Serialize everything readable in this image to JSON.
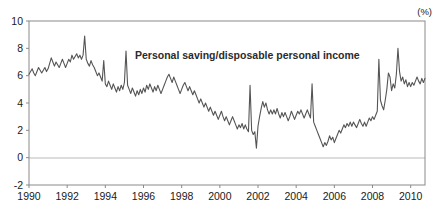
{
  "chart_data": {
    "type": "line",
    "title": "Personal saving/disposable personal income",
    "unit_label": "(%)",
    "xlabel": "",
    "ylabel": "",
    "grid": false,
    "legend_position": "inside-top-center",
    "xlim": [
      1990,
      2010.75
    ],
    "ylim": [
      -2,
      10
    ],
    "ytick_values": [
      -2,
      0,
      2,
      4,
      6,
      8,
      10
    ],
    "ytick_labels": [
      "-2",
      "0",
      "2",
      "4",
      "6",
      "8",
      "10"
    ],
    "xtick_values": [
      1990,
      1992,
      1994,
      1996,
      1998,
      2000,
      2002,
      2004,
      2006,
      2008,
      2010
    ],
    "xtick_labels": [
      "1990",
      "1992",
      "1994",
      "1996",
      "1998",
      "2000",
      "2002",
      "2004",
      "2006",
      "2008",
      "2010"
    ],
    "zero_line": 0,
    "series": [
      {
        "name": "Personal saving/disposable personal income",
        "color": "#555555",
        "x_start": 1990.0,
        "x_step": 0.08333,
        "values": [
          6.1,
          6.3,
          6.5,
          6.2,
          6.0,
          6.3,
          6.6,
          6.4,
          6.2,
          6.4,
          6.6,
          6.3,
          6.5,
          6.9,
          7.3,
          7.0,
          6.7,
          7.0,
          6.8,
          6.6,
          6.9,
          7.2,
          6.9,
          6.6,
          6.9,
          7.2,
          7.0,
          7.5,
          7.2,
          7.4,
          7.6,
          7.3,
          7.5,
          7.2,
          7.5,
          8.9,
          7.2,
          6.9,
          6.7,
          7.1,
          6.8,
          6.6,
          6.3,
          6.0,
          6.2,
          5.9,
          5.6,
          7.1,
          5.4,
          5.2,
          5.6,
          5.3,
          5.0,
          5.4,
          5.1,
          4.8,
          5.2,
          4.9,
          5.3,
          5.0,
          5.5,
          7.8,
          5.3,
          5.0,
          4.7,
          5.1,
          4.8,
          4.5,
          4.9,
          4.6,
          5.0,
          4.7,
          5.1,
          4.8,
          5.3,
          5.0,
          5.4,
          5.1,
          4.8,
          5.2,
          4.9,
          5.3,
          5.0,
          4.7,
          5.0,
          5.3,
          5.6,
          5.9,
          6.1,
          5.8,
          5.5,
          5.9,
          5.6,
          5.3,
          5.0,
          4.7,
          5.0,
          5.3,
          5.5,
          5.2,
          4.9,
          5.2,
          4.9,
          4.6,
          4.9,
          4.6,
          4.3,
          4.0,
          4.3,
          4.0,
          3.7,
          4.0,
          3.7,
          3.4,
          3.7,
          3.4,
          3.1,
          3.4,
          3.1,
          2.8,
          3.1,
          3.4,
          3.0,
          2.7,
          3.0,
          2.7,
          2.4,
          2.7,
          3.0,
          2.7,
          2.4,
          2.1,
          2.4,
          2.2,
          2.5,
          2.1,
          2.4,
          2.1,
          1.9,
          5.3,
          2.0,
          1.7,
          1.9,
          0.7,
          2.3,
          3.0,
          3.6,
          4.1,
          3.7,
          4.0,
          3.5,
          3.2,
          3.5,
          3.2,
          3.5,
          3.2,
          3.6,
          3.2,
          2.9,
          3.3,
          3.0,
          3.3,
          3.0,
          2.7,
          3.0,
          3.4,
          3.1,
          2.8,
          3.1,
          3.4,
          3.2,
          3.5,
          3.2,
          2.9,
          3.2,
          3.5,
          3.2,
          2.9,
          5.4,
          2.6,
          2.3,
          2.0,
          1.7,
          1.4,
          1.1,
          0.8,
          1.1,
          0.9,
          1.2,
          1.6,
          1.3,
          1.5,
          1.1,
          1.4,
          1.7,
          2.0,
          1.8,
          2.1,
          2.4,
          2.2,
          2.5,
          2.3,
          2.6,
          2.3,
          2.6,
          2.4,
          2.2,
          2.5,
          2.8,
          2.5,
          2.3,
          2.6,
          2.3,
          2.6,
          2.9,
          2.7,
          3.0,
          2.8,
          3.1,
          3.4,
          7.2,
          4.2,
          3.8,
          3.5,
          4.2,
          5.0,
          6.2,
          5.9,
          4.9,
          5.4,
          5.1,
          6.1,
          8.0,
          6.3,
          5.6,
          5.9,
          5.4,
          5.7,
          5.2,
          5.5,
          5.2,
          5.5,
          5.3,
          5.6,
          5.9,
          5.6,
          5.4,
          5.8,
          5.5,
          5.8
        ]
      }
    ]
  }
}
